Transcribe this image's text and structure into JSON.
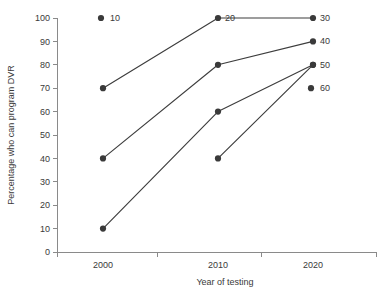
{
  "chart_data": {
    "type": "line",
    "title": "",
    "xlabel": "Year of testing",
    "ylabel": "Percentage who can program DVR",
    "categories": [
      "2000",
      "2010",
      "2020"
    ],
    "x": [
      2000,
      2010,
      2020
    ],
    "xlim": [
      1995,
      2025
    ],
    "ylim": [
      0,
      100
    ],
    "yticks": [
      0,
      10,
      20,
      30,
      40,
      50,
      60,
      70,
      80,
      90,
      100
    ],
    "ytick_labels": [
      "0",
      "10",
      "20",
      "30",
      "40",
      "50",
      "60",
      "70",
      "80",
      "90",
      "100"
    ],
    "xtick_labels": [
      "2000",
      "2010",
      "2020"
    ],
    "grid": false,
    "legend_position": "none",
    "marker": "filled-circle",
    "marker_color": "#3a3a3a",
    "line_color": "#3d3d3d",
    "axis_color": "#8a8a8a",
    "series": [
      {
        "name": "30",
        "end_label": "30",
        "points": [
          {
            "x": 2000,
            "y": 70,
            "label": ""
          },
          {
            "x": 2010,
            "y": 100,
            "label": "20"
          },
          {
            "x": 2020,
            "y": 100,
            "label": "30"
          }
        ],
        "values": [
          70,
          100,
          100
        ]
      },
      {
        "name": "40",
        "end_label": "40",
        "points": [
          {
            "x": 2000,
            "y": 40,
            "label": ""
          },
          {
            "x": 2010,
            "y": 80,
            "label": ""
          },
          {
            "x": 2020,
            "y": 90,
            "label": "40"
          }
        ],
        "values": [
          40,
          80,
          90
        ]
      },
      {
        "name": "50",
        "end_label": "50",
        "points": [
          {
            "x": 2000,
            "y": 10,
            "label": ""
          },
          {
            "x": 2010,
            "y": 60,
            "label": ""
          },
          {
            "x": 2020,
            "y": 80,
            "label": "50"
          }
        ],
        "values": [
          10,
          60,
          80
        ]
      },
      {
        "name": "partial",
        "end_label": "",
        "points": [
          {
            "x": 2010,
            "y": 40,
            "label": ""
          },
          {
            "x": 2020,
            "y": 80,
            "label": ""
          }
        ],
        "values": [
          null,
          40,
          80
        ]
      }
    ],
    "annotations": [
      {
        "text": "10",
        "x": 2000,
        "y": 100,
        "marker": true
      },
      {
        "text": "20",
        "x": 2010,
        "y": 100,
        "marker": false
      },
      {
        "text": "30",
        "x": 2020,
        "y": 100,
        "marker": false
      },
      {
        "text": "40",
        "x": 2020,
        "y": 90,
        "marker": false
      },
      {
        "text": "50",
        "x": 2020,
        "y": 80,
        "marker": false
      },
      {
        "text": "60",
        "x": 2020,
        "y": 70,
        "marker": true
      }
    ]
  }
}
